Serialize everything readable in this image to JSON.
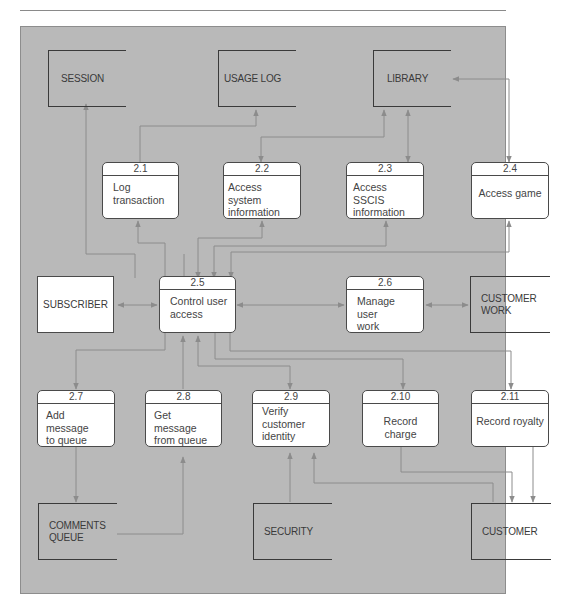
{
  "diagram": {
    "type": "data-flow-diagram",
    "colors": {
      "background": "#b9b9b9",
      "flow_line": "#8c8c8c",
      "box_fill": "#ffffff",
      "box_border": "#4a4a4a",
      "text": "#3a3a3a"
    },
    "data_stores": {
      "session": "SESSION",
      "usage_log": "USAGE LOG",
      "library": "LIBRARY",
      "customer_work_1": "CUSTOMER",
      "customer_work_2": "WORK",
      "comments_queue_1": "COMMENTS",
      "comments_queue_2": "QUEUE",
      "security": "SECURITY",
      "customer": "CUSTOMER"
    },
    "entities": {
      "subscriber": "SUBSCRIBER"
    },
    "processes": [
      {
        "id": "2.1",
        "line1": "Log",
        "line2": "transaction"
      },
      {
        "id": "2.2",
        "line1": "Access system",
        "line2": "information"
      },
      {
        "id": "2.3",
        "line1": "Access SSCIS",
        "line2": "information"
      },
      {
        "id": "2.4",
        "line1": "Access game",
        "line2": ""
      },
      {
        "id": "2.5",
        "line1": "Control user",
        "line2": "access"
      },
      {
        "id": "2.6",
        "line1": "Manage user",
        "line2": "work"
      },
      {
        "id": "2.7",
        "line1": "Add message",
        "line2": "to queue"
      },
      {
        "id": "2.8",
        "line1": "Get message",
        "line2": "from queue"
      },
      {
        "id": "2.9",
        "line1": "Verify",
        "line2": "customer",
        "line3": "identity"
      },
      {
        "id": "2.10",
        "line1": "Record charge",
        "line2": ""
      },
      {
        "id": "2.11",
        "line1": "Record royalty",
        "line2": ""
      }
    ],
    "flows": [
      {
        "from": "2.5",
        "to": "SESSION"
      },
      {
        "from": "2.1",
        "to": "USAGE LOG"
      },
      {
        "from": "2.2",
        "to": "LIBRARY",
        "bidirectional": true
      },
      {
        "from": "2.3",
        "to": "LIBRARY",
        "bidirectional": true
      },
      {
        "from": "2.4",
        "to": "LIBRARY",
        "bidirectional": true
      },
      {
        "from": "2.5",
        "to": "2.1",
        "bidirectional": true
      },
      {
        "from": "2.5",
        "to": "2.2",
        "bidirectional": true
      },
      {
        "from": "2.5",
        "to": "2.3",
        "bidirectional": true
      },
      {
        "from": "2.5",
        "to": "2.4",
        "bidirectional": true
      },
      {
        "from": "SUBSCRIBER",
        "to": "2.5",
        "bidirectional": true
      },
      {
        "from": "2.5",
        "to": "2.6",
        "bidirectional": true
      },
      {
        "from": "2.6",
        "to": "CUSTOMER WORK",
        "bidirectional": true
      },
      {
        "from": "2.5",
        "to": "2.7"
      },
      {
        "from": "2.8",
        "to": "2.5"
      },
      {
        "from": "2.5",
        "to": "2.9",
        "bidirectional": true
      },
      {
        "from": "2.5",
        "to": "2.10"
      },
      {
        "from": "2.5",
        "to": "2.11"
      },
      {
        "from": "2.7",
        "to": "COMMENTS QUEUE"
      },
      {
        "from": "COMMENTS QUEUE",
        "to": "2.8"
      },
      {
        "from": "SECURITY",
        "to": "2.9"
      },
      {
        "from": "CUSTOMER",
        "to": "2.9"
      },
      {
        "from": "2.10",
        "to": "CUSTOMER"
      },
      {
        "from": "2.11",
        "to": "CUSTOMER"
      }
    ]
  }
}
